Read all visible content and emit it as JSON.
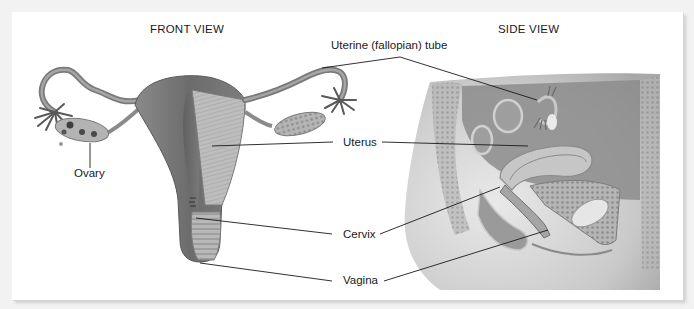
{
  "figure": {
    "views": [
      {
        "id": "front",
        "title": "FRONT VIEW"
      },
      {
        "id": "side",
        "title": "SIDE VIEW"
      }
    ],
    "labels": {
      "uterine_tube": "Uterine (fallopian) tube",
      "uterus": "Uterus",
      "ovary": "Ovary",
      "cervix": "Cervix",
      "vagina": "Vagina"
    },
    "colors": {
      "background": "#f2f2f2",
      "panel": "#ffffff",
      "tissue_dark": "#6f6f6f",
      "tissue_mid": "#9a9a9a",
      "tissue_light": "#c9c9c9",
      "leader_line": "#1a1a1a"
    }
  }
}
